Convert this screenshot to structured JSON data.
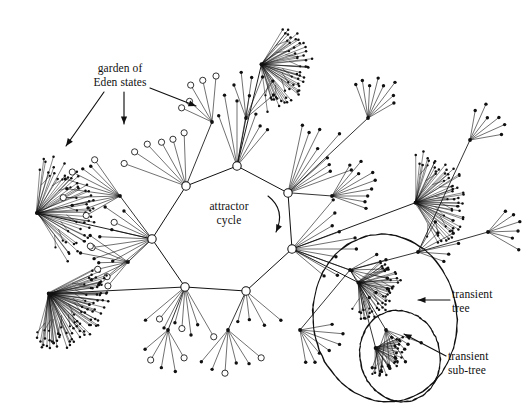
{
  "figure": {
    "background_color": "#ffffff",
    "ink_color": "#101010",
    "width": 532,
    "height": 416
  },
  "annotations": [
    {
      "id": "garden-of-eden",
      "text": "garden of\nEden states",
      "arrow_count": 3
    },
    {
      "id": "attractor-cycle",
      "text": "attractor\ncycle",
      "arrow_count": 1
    },
    {
      "id": "transient-tree",
      "text": "transient\ntree",
      "arrow_count": 1
    },
    {
      "id": "transient-sub-tree",
      "text": "transient\nsub-tree",
      "arrow_count": 1
    }
  ],
  "chart_data": {
    "type": "diagram",
    "node_styles": {
      "cycle_hub": "large open circle on attractor cycle",
      "garden_of_eden": "open circle leaf (no predecessor)",
      "transient": "small filled dot"
    },
    "attractor_cycle": {
      "node_count": 7,
      "points": [
        [
          186,
          186
        ],
        [
          152,
          239
        ],
        [
          185,
          287
        ],
        [
          246,
          291
        ],
        [
          292,
          249
        ],
        [
          288,
          193
        ],
        [
          237,
          166
        ]
      ]
    },
    "fan_hubs": [
      {
        "x": 186,
        "y": 186,
        "leaves": 6,
        "style": "open",
        "spread": [
          200,
          268
        ],
        "len": 78
      },
      {
        "x": 152,
        "y": 239,
        "leaves": 9,
        "style": "mixed",
        "spread": [
          140,
          225
        ],
        "len": 62
      },
      {
        "x": 185,
        "y": 287,
        "leaves": 8,
        "style": "mixed",
        "spread": [
          60,
          140
        ],
        "len": 58
      },
      {
        "x": 246,
        "y": 291,
        "leaves": 4,
        "style": "filled",
        "spread": [
          40,
          105
        ],
        "len": 44
      },
      {
        "x": 292,
        "y": 249,
        "leaves": 10,
        "style": "filled",
        "spread": [
          310,
          40
        ],
        "len": 66
      },
      {
        "x": 288,
        "y": 193,
        "leaves": 9,
        "style": "dense",
        "spread": [
          282,
          340
        ],
        "len": 74
      },
      {
        "x": 237,
        "y": 166,
        "leaves": 7,
        "style": "dense",
        "spread": [
          250,
          310
        ],
        "len": 70
      }
    ],
    "dense_clusters": [
      {
        "cx": 78,
        "cy": 200,
        "rx": 46,
        "ry": 58,
        "rot": -14,
        "count": 44,
        "label": "left upper fan"
      },
      {
        "cx": 92,
        "cy": 312,
        "rx": 58,
        "ry": 34,
        "rot": 36,
        "count": 70,
        "label": "left lower crescent"
      },
      {
        "cx": 300,
        "cy": 78,
        "rx": 44,
        "ry": 48,
        "rot": 18,
        "count": 46,
        "label": "top fan"
      },
      {
        "cx": 452,
        "cy": 196,
        "rx": 40,
        "ry": 52,
        "rot": -8,
        "count": 48,
        "label": "right fan"
      },
      {
        "cx": 392,
        "cy": 296,
        "rx": 40,
        "ry": 36,
        "rot": 24,
        "count": 38,
        "label": "transient tree fan"
      },
      {
        "cx": 398,
        "cy": 360,
        "rx": 28,
        "ry": 26,
        "rot": 30,
        "count": 30,
        "label": "transient sub-tree fan"
      }
    ],
    "enclosures": [
      {
        "id": "transient-tree-ellipse",
        "cx": 385,
        "cy": 318,
        "rx": 72,
        "ry": 84,
        "rot": -8
      },
      {
        "id": "transient-sub-tree-ellipse",
        "cx": 400,
        "cy": 356,
        "rx": 40,
        "ry": 46,
        "rot": -14
      }
    ]
  }
}
